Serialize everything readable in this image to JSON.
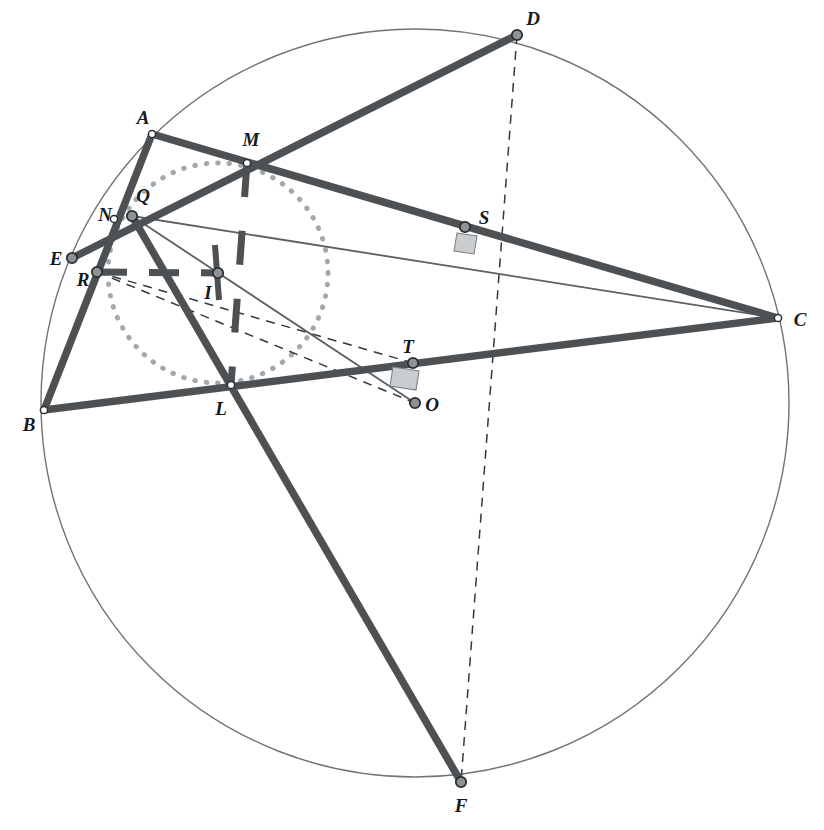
{
  "figure": {
    "background_color": "#ffffff",
    "width": 824,
    "height": 830,
    "colors": {
      "thick_stroke": "#4d5154",
      "thin_stroke": "#5a5f63",
      "circumcircle_stroke": "#6f7477",
      "incircle_dotted": "#a3a8ab",
      "dashed_thin": "#34383b",
      "point_fill": "#8d9295",
      "point_stroke": "#2b2f32",
      "label_color": "#16191c",
      "right_angle_fill": "#c9cdd0"
    },
    "circumcircle": {
      "cx": 415,
      "cy": 403,
      "r": 374
    },
    "incircle": {
      "cx": 218,
      "cy": 273,
      "r": 110
    }
  },
  "points": [
    {
      "id": "A",
      "label": "A",
      "x": 152,
      "y": 134,
      "lx": 143,
      "ly": 117,
      "marker": "small"
    },
    {
      "id": "B",
      "label": "B",
      "x": 44,
      "y": 410,
      "lx": 29,
      "ly": 424,
      "marker": "small"
    },
    {
      "id": "C",
      "label": "C",
      "x": 778,
      "y": 318,
      "lx": 800,
      "ly": 319,
      "marker": "small"
    },
    {
      "id": "D",
      "label": "D",
      "x": 517,
      "y": 35,
      "lx": 533,
      "ly": 18,
      "marker": "ring"
    },
    {
      "id": "E",
      "label": "E",
      "x": 72,
      "y": 258,
      "lx": 56,
      "ly": 258,
      "marker": "ring"
    },
    {
      "id": "F",
      "label": "F",
      "x": 461,
      "y": 782,
      "lx": 461,
      "ly": 805,
      "marker": "ring"
    },
    {
      "id": "I",
      "label": "I",
      "x": 218,
      "y": 273,
      "lx": 208,
      "ly": 292,
      "marker": "ring"
    },
    {
      "id": "L",
      "label": "L",
      "x": 231,
      "y": 385,
      "lx": 221,
      "ly": 408,
      "marker": "small"
    },
    {
      "id": "M",
      "label": "M",
      "x": 247,
      "y": 163,
      "lx": 251,
      "ly": 139,
      "marker": "small"
    },
    {
      "id": "N",
      "label": "N",
      "x": 114,
      "y": 219,
      "lx": 105,
      "ly": 214,
      "marker": "small"
    },
    {
      "id": "O",
      "label": "O",
      "x": 415,
      "y": 403,
      "lx": 432,
      "ly": 404,
      "marker": "ring"
    },
    {
      "id": "Q",
      "label": "Q",
      "x": 132,
      "y": 216,
      "lx": 143,
      "ly": 195,
      "marker": "ring"
    },
    {
      "id": "R",
      "label": "R",
      "x": 97,
      "y": 272,
      "lx": 83,
      "ly": 279,
      "marker": "ring"
    },
    {
      "id": "S",
      "label": "S",
      "x": 465,
      "y": 227,
      "lx": 484,
      "ly": 217,
      "marker": "ring"
    },
    {
      "id": "T",
      "label": "T",
      "x": 413,
      "y": 363,
      "lx": 408,
      "ly": 346,
      "marker": "ring"
    }
  ],
  "segments_thick": [
    {
      "name": "A-B",
      "from": "A",
      "to": "B"
    },
    {
      "name": "A-S-C",
      "from": "A",
      "to": "C"
    },
    {
      "name": "B-C",
      "from": "B",
      "to": "C"
    },
    {
      "name": "E-D",
      "from": "E",
      "to": "D"
    },
    {
      "name": "Q-F",
      "from": "Q",
      "to": "F"
    }
  ],
  "segments_thin": [
    {
      "name": "Q-C",
      "from": "Q",
      "to": "C"
    },
    {
      "name": "Q-O",
      "from": "Q",
      "to": "O"
    }
  ],
  "segments_dashed_thin": [
    {
      "name": "D-S-O-F",
      "from": "D",
      "to": "F"
    },
    {
      "name": "R-O",
      "from": "R",
      "to": "O"
    },
    {
      "name": "R-T",
      "from": "R",
      "to": "T"
    }
  ],
  "segments_dashed_thick": [
    {
      "name": "M-I-L",
      "from": "M",
      "to": "L"
    },
    {
      "name": "R-I",
      "from": "R",
      "to": "I"
    }
  ],
  "right_angle_marks": [
    {
      "name": "right-angle-at-S",
      "x": 465,
      "y": 227
    },
    {
      "name": "right-angle-at-T",
      "x": 413,
      "y": 363
    }
  ],
  "tick_marks": [
    {
      "name": "tick-I-up",
      "x": 218,
      "y": 273
    },
    {
      "name": "tick-I-down",
      "x": 218,
      "y": 273
    }
  ]
}
